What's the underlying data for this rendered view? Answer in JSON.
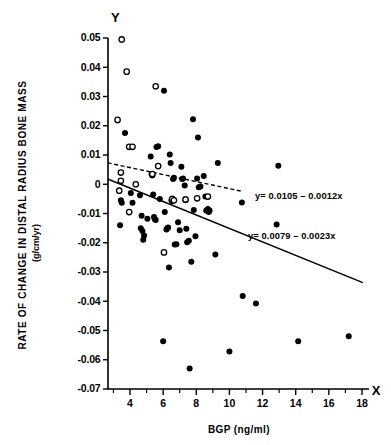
{
  "chart_data": {
    "type": "scatter",
    "title": "",
    "xlabel": "BGP (ng/ml)",
    "ylabel": "RATE OF CHANGE IN DISTAL RADIUS BONE MASS",
    "ylabel_units": "(g/cm/yr)",
    "x_axis_letter": "X",
    "y_axis_letter": "Y",
    "xlim": [
      2.65,
      18.6
    ],
    "ylim": [
      -0.07,
      0.05
    ],
    "xticks": [
      4,
      6,
      8,
      10,
      12,
      14,
      16,
      18
    ],
    "xtick_labels": [
      "4",
      "6",
      "8",
      "10",
      "12",
      "14",
      "16",
      "18"
    ],
    "x_minor_ticks": [
      3,
      5,
      7,
      9,
      11,
      13,
      15,
      17
    ],
    "yticks": [
      0.05,
      0.04,
      0.03,
      0.02,
      0.01,
      0,
      -0.01,
      -0.02,
      -0.03,
      -0.04,
      -0.05,
      -0.06,
      -0.07
    ],
    "ytick_labels": [
      "0.05",
      "0.04",
      "0.03",
      "0.02",
      "0.01",
      "0",
      "-0.01",
      "-0.02",
      "-0.03",
      "-0.04",
      "-0.05",
      "-0.06",
      "-0.07"
    ],
    "grid": false,
    "legend": "none",
    "series": [
      {
        "name": "filled-markers",
        "marker": "filled-circle",
        "color": "#000000",
        "points": [
          [
            3.7,
            0.0175
          ],
          [
            3.45,
            -0.0055
          ],
          [
            3.5,
            -0.0063
          ],
          [
            3.4,
            -0.014
          ],
          [
            4.05,
            -0.003
          ],
          [
            4.15,
            -0.0063
          ],
          [
            4.6,
            -0.0038
          ],
          [
            4.65,
            -0.015
          ],
          [
            4.75,
            -0.016
          ],
          [
            4.8,
            -0.019
          ],
          [
            4.85,
            -0.0175
          ],
          [
            4.7,
            -0.0108
          ],
          [
            5.05,
            -0.0118
          ],
          [
            5.25,
            0.0095
          ],
          [
            5.3,
            0.0035
          ],
          [
            5.35,
            0.003
          ],
          [
            5.4,
            -0.0035
          ],
          [
            5.45,
            -0.0112
          ],
          [
            5.5,
            -0.012
          ],
          [
            5.55,
            -0.0122
          ],
          [
            5.6,
            0.0127
          ],
          [
            5.7,
            0.013
          ],
          [
            5.8,
            -0.005
          ],
          [
            6.05,
            0.032
          ],
          [
            6.1,
            -0.0095
          ],
          [
            6.2,
            -0.0155
          ],
          [
            6.25,
            -0.015
          ],
          [
            6.3,
            -0.0148
          ],
          [
            6.35,
            -0.0285
          ],
          [
            6.4,
            0.0102
          ],
          [
            6.45,
            0.0073
          ],
          [
            6.5,
            -0.0055
          ],
          [
            6.55,
            -0.0058
          ],
          [
            6.6,
            0.0018
          ],
          [
            6.65,
            0.0022
          ],
          [
            6.7,
            -0.0206
          ],
          [
            6.0,
            -0.0537
          ],
          [
            6.8,
            -0.0205
          ],
          [
            6.9,
            -0.013
          ],
          [
            7.0,
            -0.0157
          ],
          [
            7.1,
            0.006
          ],
          [
            7.15,
            0.0018
          ],
          [
            7.2,
            0.002
          ],
          [
            7.3,
            -0.0004
          ],
          [
            7.35,
            -0.0055
          ],
          [
            7.4,
            -0.0152
          ],
          [
            7.45,
            -0.0198
          ],
          [
            7.55,
            -0.0193
          ],
          [
            7.6,
            -0.063
          ],
          [
            7.7,
            -0.0265
          ],
          [
            7.8,
            0.0222
          ],
          [
            7.85,
            -0.0088
          ],
          [
            7.95,
            -0.0178
          ],
          [
            8.05,
            0.002
          ],
          [
            8.1,
            0.016
          ],
          [
            8.15,
            -0.001
          ],
          [
            8.25,
            -0.0008
          ],
          [
            8.45,
            0.0028
          ],
          [
            8.55,
            -0.0042
          ],
          [
            8.6,
            -0.009
          ],
          [
            8.7,
            -0.0085
          ],
          [
            8.75,
            -0.0095
          ],
          [
            8.8,
            -0.009
          ],
          [
            9.15,
            -0.024
          ],
          [
            9.3,
            0.0073
          ],
          [
            10.0,
            -0.0572
          ],
          [
            10.75,
            -0.0062
          ],
          [
            10.8,
            -0.0382
          ],
          [
            11.6,
            -0.0408
          ],
          [
            12.95,
            0.0063
          ],
          [
            12.85,
            -0.0138
          ],
          [
            14.15,
            -0.0537
          ],
          [
            17.2,
            -0.052
          ]
        ]
      },
      {
        "name": "open-markers",
        "marker": "open-circle",
        "color": "#000000",
        "points": [
          [
            3.5,
            0.0495
          ],
          [
            3.8,
            0.0385
          ],
          [
            3.25,
            0.022
          ],
          [
            3.95,
            0.0128
          ],
          [
            4.15,
            0.0128
          ],
          [
            3.45,
            0.004
          ],
          [
            3.45,
            0.0012
          ],
          [
            3.35,
            -0.0022
          ],
          [
            3.95,
            -0.0095
          ],
          [
            4.35,
            0.0
          ],
          [
            5.35,
            0.0035
          ],
          [
            5.55,
            0.0335
          ],
          [
            5.7,
            0.0062
          ],
          [
            6.55,
            -0.005
          ],
          [
            6.65,
            -0.0055
          ],
          [
            6.05,
            -0.0233
          ],
          [
            7.35,
            -0.0052
          ],
          [
            8.05,
            -0.0048
          ],
          [
            8.7,
            -0.0042
          ]
        ]
      }
    ],
    "fit_lines": [
      {
        "name": "dashed-regression",
        "style": "dashed",
        "label": "y= 0.0105 – 0.0012x",
        "intercept": 0.0105,
        "slope": -0.0012,
        "x_start": 2.65,
        "x_end": 10.75,
        "label_x": 255,
        "label_y": 199
      },
      {
        "name": "solid-regression",
        "style": "solid",
        "label": "y= 0.0079 – 0.0023x",
        "intercept": 0.0079,
        "slope": -0.0023,
        "x_start": 2.65,
        "x_end": 18.05,
        "label_x": 248,
        "label_y": 239
      }
    ]
  }
}
